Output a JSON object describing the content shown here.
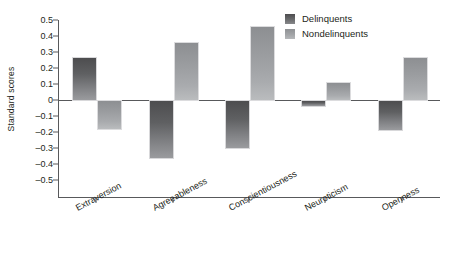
{
  "chart_data": {
    "type": "bar",
    "title": "",
    "xlabel": "",
    "ylabel": "Standard scores",
    "ylim": [
      -0.5,
      0.5
    ],
    "ytick_values": [
      0.5,
      0.4,
      0.3,
      0.2,
      0.1,
      0,
      -0.1,
      -0.2,
      -0.3,
      -0.4,
      -0.5
    ],
    "ytick_labels": [
      "0.5",
      "0.4",
      "0.3",
      "0.2",
      "0.1",
      "0",
      "–0.1",
      "–0.2",
      "–0.3",
      "–0.4",
      "–0.5"
    ],
    "grid": false,
    "legend_position": "top-right",
    "categories": [
      "Extraversion",
      "Agreeableness",
      "Conscientiousness",
      "Neuroticism",
      "Openness"
    ],
    "series": [
      {
        "name": "Delinquents",
        "color": "#5f6062",
        "values": [
          0.27,
          -0.36,
          -0.3,
          -0.04,
          -0.19
        ]
      },
      {
        "name": "Nondelinquents",
        "color": "#a2a4a7",
        "values": [
          -0.18,
          0.36,
          0.46,
          0.11,
          0.27
        ]
      }
    ]
  },
  "legend": {
    "items": [
      {
        "label": "Delinquents",
        "swatch": "delinquent-swatch-icon"
      },
      {
        "label": "Nondelinquents",
        "swatch": "nondelinquent-swatch-icon"
      }
    ]
  },
  "axes": {
    "y_title": "Standard scores"
  }
}
